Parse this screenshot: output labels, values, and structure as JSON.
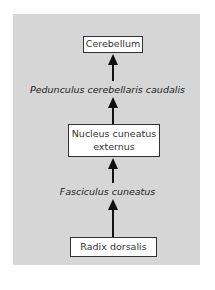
{
  "diagram": {
    "type": "flowchart",
    "direction": "bottom-to-top",
    "background_color": "#d6d6d6",
    "nodes": [
      {
        "id": "cerebellum",
        "label": "Cerebellum"
      },
      {
        "id": "nucleus",
        "label_line1": "Nucleus cuneatus",
        "label_line2": "externus"
      },
      {
        "id": "radix",
        "label": "Radix dorsalis"
      }
    ],
    "edges": [
      {
        "from": "radix",
        "to": "nucleus",
        "label": "Fasciculus cuneatus"
      },
      {
        "from": "nucleus",
        "to": "cerebellum",
        "label": "Pedunculus cerebellaris caudalis"
      }
    ]
  }
}
